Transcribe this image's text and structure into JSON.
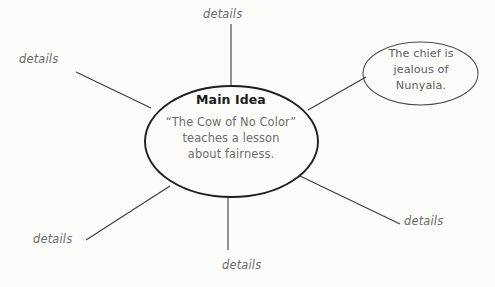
{
  "diagram": {
    "type": "main-idea-web-graphic-organizer",
    "background_color": "#fcfcfa",
    "line_color": "#3a3a3a",
    "center": {
      "title": "Main Idea",
      "title_color": "#1b1b1b",
      "body_lines": [
        "“The Cow of No Color”",
        "teaches a lesson",
        "about fairness."
      ],
      "body_text": "“The Cow of No Color” teaches a lesson about fairness.",
      "body_color": "#6d6d6d",
      "shape": "ellipse",
      "outline_color": "#1f1f1f"
    },
    "satellite": {
      "body_lines": [
        "The chief is",
        "jealous of",
        "Nunyala."
      ],
      "body_text": "The chief is jealous of Nunyala.",
      "body_color": "#5e5e5e",
      "shape": "ellipse",
      "outline_color": "#4a4a4a"
    },
    "detail_labels": {
      "top": "details",
      "upper_left": "details",
      "lower_left": "details",
      "bottom": "details",
      "lower_right": "details"
    }
  }
}
